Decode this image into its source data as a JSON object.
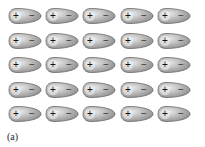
{
  "diagram": {
    "label": "(a)",
    "rows": 5,
    "cols": 5,
    "dipole": {
      "positive": "+",
      "negative": "−",
      "fill_light": "#e8e8e8",
      "fill_dark": "#8a8a8a",
      "outline": "#6a6a6a"
    },
    "col_x": [
      8,
      45,
      82,
      120,
      157
    ],
    "row_y": [
      7,
      32,
      56,
      81,
      105
    ]
  }
}
